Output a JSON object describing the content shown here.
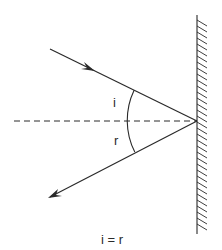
{
  "diagram": {
    "labels": {
      "incidence_angle": "i",
      "reflection_angle": "r",
      "equation": "i = r"
    },
    "elements": {
      "mirror": "plane-mirror",
      "normal": "dashed-normal-line",
      "incident_ray": "incident-ray",
      "reflected_ray": "reflected-ray"
    },
    "colors": {
      "stroke": "#2a2a2a",
      "background": "#ffffff"
    }
  }
}
